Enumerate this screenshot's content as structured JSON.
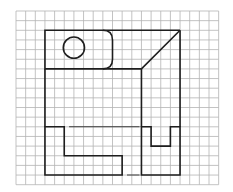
{
  "diagram": {
    "type": "orthographic-projection-on-grid",
    "grid": {
      "x0": 16,
      "y0": 11,
      "cell": 9.65,
      "cols": 21,
      "rows": 18,
      "line_color": "#b4b4b4"
    },
    "ink_color": "#1e1e1e",
    "views": {
      "top_view": {
        "outline": [
          [
            3,
            2
          ],
          [
            17,
            2
          ],
          [
            17,
            12
          ],
          [
            5,
            6
          ]
        ],
        "front_panel": {
          "x1": 3,
          "y1": 2,
          "x2": 10,
          "y2": 6,
          "rounded_corner_radius": 1
        },
        "hole": {
          "cx": 6,
          "cy": 3.8,
          "r": 1.1
        },
        "diagonal": {
          "from": [
            13,
            6
          ],
          "to": [
            17,
            2
          ]
        }
      },
      "front_view": {
        "l_shape": [
          [
            3,
            12
          ],
          [
            5,
            12
          ],
          [
            5,
            15
          ],
          [
            11,
            15
          ],
          [
            11,
            17
          ],
          [
            3,
            17
          ]
        ],
        "hidden_lines": [
          {
            "from": [
              5.5,
              12
            ],
            "to": [
              12.8,
              12
            ]
          },
          {
            "from": [
              11.5,
              17
            ],
            "to": [
              12.8,
              17
            ]
          }
        ]
      },
      "side_view": {
        "u_shape": [
          [
            13,
            12
          ],
          [
            14,
            12
          ],
          [
            14,
            14
          ],
          [
            16,
            14
          ],
          [
            16,
            12
          ],
          [
            17,
            12
          ],
          [
            17,
            17
          ],
          [
            13,
            17
          ]
        ]
      },
      "connectors": [
        {
          "from": [
            3,
            6
          ],
          "to": [
            3,
            12
          ]
        },
        {
          "from": [
            13,
            6
          ],
          "to": [
            13,
            12
          ]
        },
        {
          "from": [
            17,
            2
          ],
          "to": [
            17,
            12
          ]
        }
      ]
    }
  }
}
